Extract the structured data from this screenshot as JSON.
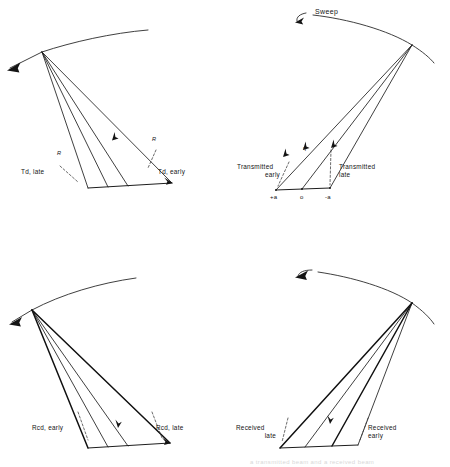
{
  "figure": {
    "caption_bleed": "a transmitted beam and a received beam"
  },
  "panels": [
    {
      "id": "top-left",
      "name": "transmitted-delay-panel",
      "sweep_label": "",
      "labels": {
        "left": "Td, late",
        "right": "Td, early",
        "marker_left": "R",
        "marker_right": "R"
      }
    },
    {
      "id": "top-right",
      "name": "transmitted-beam-panel",
      "sweep_label": "Sweep",
      "labels": {
        "left_line1": "Transmitted",
        "left_line2": "early",
        "right_line1": "Transmitted",
        "right_line2": "late",
        "axis_left": "+a",
        "axis_center": "o",
        "axis_right": "-a",
        "angle_left": "η",
        "angle_mid": "θ",
        "angle_right": "θ"
      }
    },
    {
      "id": "bottom-left",
      "name": "received-delay-panel",
      "labels": {
        "left": "Rcd, early",
        "right": "Rcd, late"
      }
    },
    {
      "id": "bottom-right",
      "name": "received-beam-panel",
      "labels": {
        "left_line1": "Received",
        "left_line2": "late",
        "right_line1": "Received",
        "right_line2": "early"
      }
    }
  ],
  "colors": {
    "ink": "#1d1d1d",
    "paper": "#ffffff"
  }
}
